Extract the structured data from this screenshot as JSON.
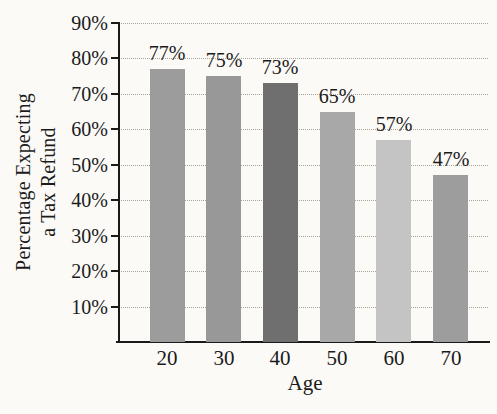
{
  "figure": {
    "background_color": "#fbfaf7",
    "axis_color": "#1a1a1a",
    "gridline_color": "#a9a398",
    "text_color": "#1b1b1b"
  },
  "chart_data": {
    "type": "bar",
    "title": "",
    "xlabel": "Age",
    "ylabel": "Percentage Expecting a Tax Refund",
    "ylabel_lines": [
      "Percentage Expecting",
      "a Tax Refund"
    ],
    "categories": [
      "20",
      "30",
      "40",
      "50",
      "60",
      "70"
    ],
    "values": [
      77,
      75,
      73,
      65,
      57,
      47
    ],
    "value_labels": [
      "77%",
      "75%",
      "73%",
      "65%",
      "57%",
      "47%"
    ],
    "bar_colors": [
      "#9c9c9c",
      "#989898",
      "#6f6f6f",
      "#a8a8a8",
      "#c4c4c4",
      "#9d9d9d"
    ],
    "y_ticks": [
      10,
      20,
      30,
      40,
      50,
      60,
      70,
      80,
      90
    ],
    "y_tick_labels": [
      "10%",
      "20%",
      "30%",
      "40%",
      "50%",
      "60%",
      "70%",
      "80%",
      "90%"
    ],
    "ylim": [
      0,
      90
    ],
    "grid": "horizontal-dotted",
    "legend": "none"
  }
}
